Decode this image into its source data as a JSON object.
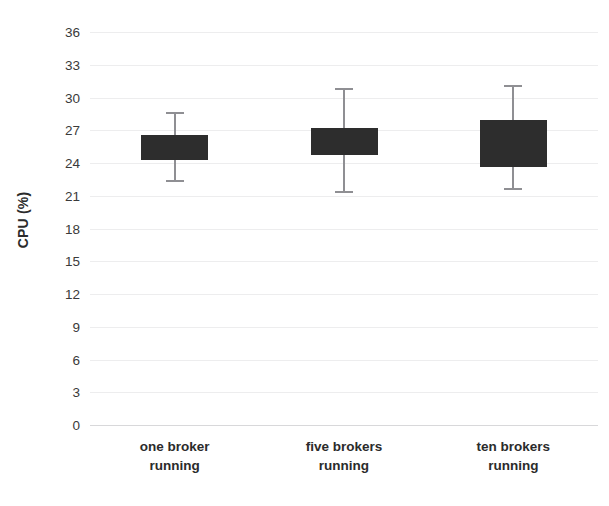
{
  "chart_data": {
    "type": "box",
    "title": "",
    "xlabel": "",
    "ylabel": "CPU (%)",
    "categories": [
      "one broker running",
      "five brokers running",
      "ten brokers running"
    ],
    "category_lines": [
      [
        "one broker",
        "running"
      ],
      [
        "five brokers",
        "running"
      ],
      [
        "ten brokers",
        "running"
      ]
    ],
    "ylim": [
      0,
      36
    ],
    "ytick_step": 3,
    "yticks": [
      36,
      33,
      30,
      27,
      24,
      21,
      18,
      15,
      12,
      9,
      6,
      3,
      0
    ],
    "grid": true,
    "legend": "none",
    "boxes": [
      {
        "category": "one broker running",
        "whisker_high": 28.7,
        "box_top": 26.6,
        "median": 25.4,
        "box_bottom": 24.3,
        "whisker_low": 22.4
      },
      {
        "category": "five brokers running",
        "whisker_high": 30.9,
        "box_top": 27.2,
        "median": 26.0,
        "box_bottom": 24.7,
        "whisker_low": 21.4
      },
      {
        "category": "ten brokers running",
        "whisker_high": 31.1,
        "box_top": 27.9,
        "median": 25.8,
        "box_bottom": 23.6,
        "whisker_low": 21.7
      }
    ],
    "colors": {
      "box_fill": "#2d2d2d",
      "whisker": "#8f8f93",
      "gridline": "#ededee",
      "baseline": "#d8d8da",
      "text": "#2b2b2b",
      "background": "#ffffff"
    }
  }
}
